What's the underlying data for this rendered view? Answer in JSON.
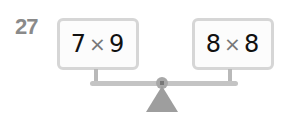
{
  "problem": {
    "number": "27",
    "left_expression": {
      "a": "7",
      "op": "×",
      "b": "9"
    },
    "right_expression": {
      "a": "8",
      "op": "×",
      "b": "8"
    },
    "figure": "balance-scale"
  }
}
